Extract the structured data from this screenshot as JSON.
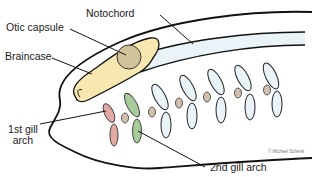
{
  "diagram": {
    "labels": {
      "notochord": "Notochord",
      "otic_capsule": "Otic capsule",
      "braincase": "Braincase",
      "first_gill_arch_line1": "1st gill",
      "first_gill_arch_line2": "arch",
      "second_gill_arch": "2nd gill arch"
    },
    "copyright": "© Michael Schenk",
    "colors": {
      "outline": "#111111",
      "braincase_fill": "#f7e7b0",
      "otic_capsule_fill": "#d2c49a",
      "notochord_fill": "#eaf3f8",
      "gill_arch_fill": "#eaf3f8",
      "first_gill_arch_fill": "#e2aaa3",
      "second_gill_arch_fill": "#a7cc9a",
      "gill_nodule_fill": "#d2bfae"
    }
  }
}
